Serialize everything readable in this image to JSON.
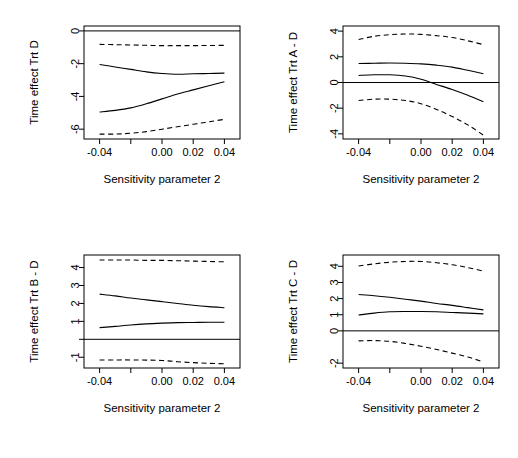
{
  "figure": {
    "width": 518,
    "height": 458,
    "background": "#ffffff",
    "line_color": "#000000",
    "layout": "2x2 grid of sensitivity-analysis line plots"
  },
  "chart_data": [
    {
      "type": "line",
      "panel": "top-left",
      "title": "",
      "xlabel": "Sensitivity parameter 2",
      "ylabel": "Time effect Trt D",
      "xlim": [
        -0.05,
        0.05
      ],
      "ylim": [
        -6.6,
        0.3
      ],
      "xticks": [
        -0.04,
        -0.02,
        0.0,
        0.02,
        0.04
      ],
      "xticklabels": [
        "-0.04",
        "",
        "0.00",
        "0.02",
        "0.04"
      ],
      "yticks": [
        0,
        -2,
        -4,
        -6
      ],
      "yticklabels": [
        "0",
        "-2",
        "-4",
        "-6"
      ],
      "grid": false,
      "legend": null,
      "reference_line": {
        "y": 0,
        "style": "solid"
      },
      "x": [
        -0.04,
        -0.03,
        -0.02,
        -0.01,
        0.0,
        0.01,
        0.02,
        0.03,
        0.04
      ],
      "series": [
        {
          "name": "upper confidence band",
          "style": "dashed",
          "values": [
            -0.82,
            -0.84,
            -0.86,
            -0.88,
            -0.9,
            -0.9,
            -0.9,
            -0.89,
            -0.88
          ]
        },
        {
          "name": "estimate upper",
          "style": "solid",
          "values": [
            -2.05,
            -2.2,
            -2.35,
            -2.5,
            -2.6,
            -2.65,
            -2.62,
            -2.6,
            -2.58
          ]
        },
        {
          "name": "estimate lower",
          "style": "solid",
          "values": [
            -4.95,
            -4.85,
            -4.7,
            -4.45,
            -4.15,
            -3.85,
            -3.6,
            -3.35,
            -3.1
          ]
        },
        {
          "name": "lower confidence band",
          "style": "dashed",
          "values": [
            -6.3,
            -6.3,
            -6.25,
            -6.15,
            -6.0,
            -5.85,
            -5.7,
            -5.55,
            -5.4
          ]
        }
      ]
    },
    {
      "type": "line",
      "panel": "top-right",
      "title": "",
      "xlabel": "Sensitivity parameter 2",
      "ylabel": "Time effect Trt A - D",
      "xlim": [
        -0.05,
        0.05
      ],
      "ylim": [
        -4.4,
        4.4
      ],
      "xticks": [
        -0.04,
        -0.02,
        0.0,
        0.02,
        0.04
      ],
      "xticklabels": [
        "-0.04",
        "",
        "0.00",
        "0.02",
        "0.04"
      ],
      "yticks": [
        4,
        2,
        0,
        -2,
        -4
      ],
      "yticklabels": [
        "4",
        "2",
        "0",
        "-2",
        "-4"
      ],
      "grid": false,
      "legend": null,
      "reference_line": {
        "y": 0,
        "style": "solid"
      },
      "x": [
        -0.04,
        -0.03,
        -0.02,
        -0.01,
        0.0,
        0.01,
        0.02,
        0.03,
        0.04
      ],
      "series": [
        {
          "name": "upper confidence band",
          "style": "dashed",
          "values": [
            3.35,
            3.6,
            3.72,
            3.78,
            3.75,
            3.65,
            3.5,
            3.25,
            2.95
          ]
        },
        {
          "name": "estimate upper",
          "style": "solid",
          "values": [
            1.48,
            1.5,
            1.52,
            1.5,
            1.45,
            1.35,
            1.2,
            0.95,
            0.68
          ]
        },
        {
          "name": "estimate lower",
          "style": "solid",
          "values": [
            0.55,
            0.6,
            0.6,
            0.5,
            0.25,
            -0.15,
            -0.55,
            -1.0,
            -1.5
          ]
        },
        {
          "name": "lower confidence band",
          "style": "dashed",
          "values": [
            -1.4,
            -1.3,
            -1.3,
            -1.4,
            -1.65,
            -2.1,
            -2.65,
            -3.3,
            -4.1
          ]
        }
      ]
    },
    {
      "type": "line",
      "panel": "bottom-left",
      "title": "",
      "xlabel": "Sensitivity parameter 2",
      "ylabel": "Time effect Trt B - D",
      "xlim": [
        -0.05,
        0.05
      ],
      "ylim": [
        -1.6,
        4.7
      ],
      "xticks": [
        -0.04,
        -0.02,
        0.0,
        0.02,
        0.04
      ],
      "xticklabels": [
        "-0.04",
        "",
        "0.00",
        "0.02",
        "0.04"
      ],
      "yticks": [
        4,
        3,
        2,
        1,
        0,
        -1
      ],
      "yticklabels": [
        "4",
        "3",
        "2",
        "1",
        "",
        "-1"
      ],
      "grid": false,
      "legend": null,
      "reference_line": {
        "y": 0,
        "style": "solid"
      },
      "x": [
        -0.04,
        -0.03,
        -0.02,
        -0.01,
        0.0,
        0.01,
        0.02,
        0.03,
        0.04
      ],
      "series": [
        {
          "name": "upper confidence band",
          "style": "dashed",
          "values": [
            4.42,
            4.42,
            4.42,
            4.4,
            4.4,
            4.38,
            4.36,
            4.34,
            4.32
          ]
        },
        {
          "name": "estimate upper",
          "style": "solid",
          "values": [
            2.52,
            2.42,
            2.3,
            2.2,
            2.1,
            2.0,
            1.9,
            1.82,
            1.76
          ]
        },
        {
          "name": "estimate lower",
          "style": "solid",
          "values": [
            0.65,
            0.72,
            0.8,
            0.86,
            0.9,
            0.93,
            0.94,
            0.95,
            0.95
          ]
        },
        {
          "name": "lower confidence band",
          "style": "dashed",
          "values": [
            -1.15,
            -1.15,
            -1.15,
            -1.16,
            -1.18,
            -1.25,
            -1.3,
            -1.34,
            -1.36
          ]
        }
      ]
    },
    {
      "type": "line",
      "panel": "bottom-right",
      "title": "",
      "xlabel": "Sensitivity parameter 2",
      "ylabel": "Time effect Trt C - D",
      "xlim": [
        -0.05,
        0.05
      ],
      "ylim": [
        -2.3,
        4.7
      ],
      "xticks": [
        -0.04,
        -0.02,
        0.0,
        0.02,
        0.04
      ],
      "xticklabels": [
        "-0.04",
        "",
        "0.00",
        "0.02",
        "0.04"
      ],
      "yticks": [
        4,
        3,
        2,
        1,
        0,
        -2
      ],
      "yticklabels": [
        "4",
        "3",
        "2",
        "1",
        "0",
        "-2"
      ],
      "grid": false,
      "legend": null,
      "reference_line": {
        "y": 0,
        "style": "solid"
      },
      "x": [
        -0.04,
        -0.03,
        -0.02,
        -0.01,
        0.0,
        0.01,
        0.02,
        0.03,
        0.04
      ],
      "series": [
        {
          "name": "upper confidence band",
          "style": "dashed",
          "values": [
            4.02,
            4.15,
            4.25,
            4.3,
            4.3,
            4.22,
            4.1,
            3.92,
            3.7
          ]
        },
        {
          "name": "estimate upper",
          "style": "solid",
          "values": [
            2.25,
            2.18,
            2.08,
            1.96,
            1.84,
            1.7,
            1.58,
            1.44,
            1.3
          ]
        },
        {
          "name": "estimate lower",
          "style": "solid",
          "values": [
            0.98,
            1.1,
            1.18,
            1.2,
            1.2,
            1.18,
            1.14,
            1.1,
            1.05
          ]
        },
        {
          "name": "lower confidence band",
          "style": "dashed",
          "values": [
            -0.62,
            -0.6,
            -0.65,
            -0.78,
            -0.95,
            -1.15,
            -1.38,
            -1.62,
            -1.92
          ]
        }
      ]
    }
  ]
}
